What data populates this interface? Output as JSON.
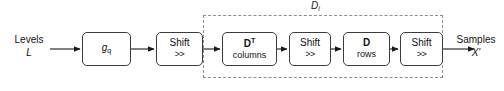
{
  "diagram": {
    "type": "block-diagram",
    "colors": {
      "block_border": "#3c3c3c",
      "group_border": "#8d8d8d",
      "arrow": "#1a1a1a",
      "text": "#111111",
      "background": "#ffffff"
    },
    "input": {
      "line1": "Levels",
      "line2": "L"
    },
    "output": {
      "line1": "Samples",
      "line2": "X'"
    },
    "group": {
      "label_main": "D",
      "label_sub": "i"
    },
    "blocks": [
      {
        "id": "gq",
        "main": "g",
        "sub": "q",
        "second": "",
        "style": "italic-sub"
      },
      {
        "id": "shift1",
        "main": "Shift",
        "sub": "",
        "second": ">>",
        "style": "two-line"
      },
      {
        "id": "dt",
        "main": "D",
        "sup": "T",
        "second": "columns",
        "style": "bold-sup"
      },
      {
        "id": "shift2",
        "main": "Shift",
        "sub": "",
        "second": ">>",
        "style": "two-line"
      },
      {
        "id": "d",
        "main": "D",
        "sup": "",
        "second": "rows",
        "style": "bold"
      },
      {
        "id": "shift3",
        "main": "Shift",
        "sub": "",
        "second": ">>",
        "style": "two-line"
      }
    ],
    "connectors": [
      {
        "from": "input",
        "to": "gq"
      },
      {
        "from": "gq",
        "to": "shift1"
      },
      {
        "from": "shift1",
        "to": "dt"
      },
      {
        "from": "dt",
        "to": "shift2"
      },
      {
        "from": "shift2",
        "to": "d"
      },
      {
        "from": "d",
        "to": "shift3"
      },
      {
        "from": "shift3",
        "to": "output"
      }
    ]
  }
}
